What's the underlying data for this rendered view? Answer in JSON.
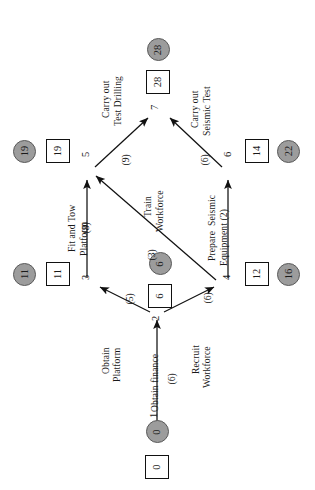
{
  "diagram": {
    "orientation": "rotated-90",
    "colors": {
      "node_circle_fill": "#9c9c9c",
      "node_square_fill": "#ffffff",
      "stroke": "#111111"
    },
    "nodes": [
      {
        "id": "1",
        "index": "1",
        "square": "0",
        "circle": "0"
      },
      {
        "id": "2",
        "index": "2",
        "square": "6",
        "circle": "6"
      },
      {
        "id": "3",
        "index": "3",
        "square": "11",
        "circle": "11"
      },
      {
        "id": "4",
        "index": "4",
        "square": "12",
        "circle": "16"
      },
      {
        "id": "5",
        "index": "5",
        "square": "19",
        "circle": "19"
      },
      {
        "id": "6",
        "index": "6",
        "square": "14",
        "circle": "22"
      },
      {
        "id": "7",
        "index": "7",
        "square": "28",
        "circle": "28"
      }
    ],
    "edges": [
      {
        "id": "e1",
        "from": "1",
        "to": "2",
        "label_line1": "Obtain finance",
        "label_line2": "",
        "duration": "(6)"
      },
      {
        "id": "e2",
        "from": "2",
        "to": "3",
        "label_line1": "Obtain",
        "label_line2": "Platform",
        "duration": "(5)"
      },
      {
        "id": "e3",
        "from": "2",
        "to": "4",
        "label_line1": "Recruit",
        "label_line2": "Workforce",
        "duration": "(6)"
      },
      {
        "id": "e4",
        "from": "3",
        "to": "5",
        "label_line1": "Fit and Tow",
        "label_line2": "Platform",
        "duration": "(8)"
      },
      {
        "id": "e5",
        "from": "4",
        "to": "5",
        "label_line1": "Train",
        "label_line2": "Workforce",
        "duration": "(3)"
      },
      {
        "id": "e6",
        "from": "4",
        "to": "6",
        "label_line1": "Prepare  Seismic",
        "label_line2": "Equipment (2)",
        "duration": ""
      },
      {
        "id": "e7",
        "from": "5",
        "to": "7",
        "label_line1": "Carry out",
        "label_line2": "Test Drilling",
        "duration": "(9)"
      },
      {
        "id": "e8",
        "from": "6",
        "to": "7",
        "label_line1": "Carry out",
        "label_line2": "Seismic Test",
        "duration": "(6)"
      }
    ]
  }
}
